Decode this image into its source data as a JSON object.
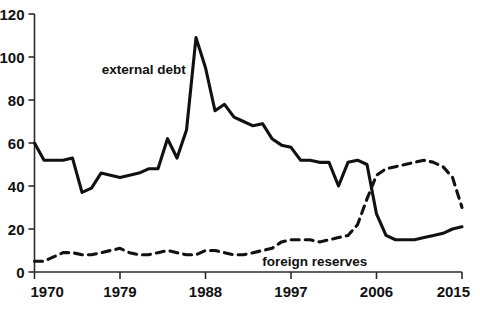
{
  "chart_data": {
    "type": "line",
    "title": "",
    "subtitle": "",
    "xlabel": "",
    "ylabel": "",
    "grid": false,
    "legend_position": "inline-annotations",
    "xlim": [
      1970,
      2015
    ],
    "ylim": [
      0,
      120
    ],
    "x_ticks": [
      1970,
      1979,
      1988,
      1997,
      2006,
      2015
    ],
    "x_tick_labels": [
      "1970",
      "1979",
      "1988",
      "1997",
      "2006",
      "2015"
    ],
    "y_ticks": [
      0,
      20,
      40,
      60,
      80,
      100,
      120
    ],
    "y_tick_labels": [
      "0",
      "20",
      "40",
      "60",
      "80",
      "100",
      "120"
    ],
    "annotations": [
      {
        "text": "external debt",
        "x": 1981.5,
        "y": 92,
        "series": "external debt"
      },
      {
        "text": "foreign reserves",
        "x": 1999.5,
        "y": 3,
        "series": "foreign reserves"
      }
    ],
    "series": [
      {
        "name": "external debt",
        "style": "solid",
        "color": "#111111",
        "x": [
          1970,
          1971,
          1972,
          1973,
          1974,
          1975,
          1976,
          1977,
          1978,
          1979,
          1980,
          1981,
          1982,
          1983,
          1984,
          1985,
          1986,
          1987,
          1988,
          1989,
          1990,
          1991,
          1992,
          1993,
          1994,
          1995,
          1996,
          1997,
          1998,
          1999,
          2000,
          2001,
          2002,
          2003,
          2004,
          2005,
          2006,
          2007,
          2008,
          2009,
          2010,
          2011,
          2012,
          2013,
          2014,
          2015
        ],
        "values": [
          60,
          52,
          52,
          52,
          53,
          37,
          39,
          46,
          45,
          44,
          45,
          46,
          48,
          48,
          62,
          53,
          66,
          109,
          95,
          75,
          78,
          72,
          70,
          68,
          69,
          62,
          59,
          58,
          52,
          52,
          51,
          51,
          40,
          51,
          52,
          50,
          27,
          17,
          15,
          15,
          15,
          16,
          17,
          18,
          20,
          21
        ]
      },
      {
        "name": "foreign reserves",
        "style": "dashed",
        "color": "#111111",
        "x": [
          1970,
          1971,
          1972,
          1973,
          1974,
          1975,
          1976,
          1977,
          1978,
          1979,
          1980,
          1981,
          1982,
          1983,
          1984,
          1985,
          1986,
          1987,
          1988,
          1989,
          1990,
          1991,
          1992,
          1993,
          1994,
          1995,
          1996,
          1997,
          1998,
          1999,
          2000,
          2001,
          2002,
          2003,
          2004,
          2005,
          2006,
          2007,
          2008,
          2009,
          2010,
          2011,
          2012,
          2013,
          2014,
          2015
        ],
        "values": [
          5,
          5,
          7,
          9,
          9,
          8,
          8,
          9,
          10,
          11,
          9,
          8,
          8,
          9,
          10,
          9,
          8,
          8,
          10,
          10,
          9,
          8,
          8,
          9,
          10,
          11,
          14,
          15,
          15,
          15,
          14,
          15,
          16,
          17,
          22,
          34,
          45,
          48,
          49,
          50,
          51,
          52,
          51,
          49,
          44,
          30
        ]
      }
    ]
  },
  "labels": {
    "external_debt": "external debt",
    "foreign_reserves": "foreign reserves"
  }
}
